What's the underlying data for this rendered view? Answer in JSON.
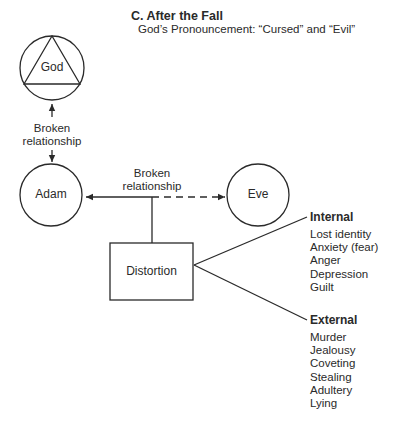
{
  "header": {
    "title": "C.  After the Fall",
    "subtitle": "God’s Pronouncement: “Cursed” and “Evil”"
  },
  "nodes": {
    "god": "God",
    "adam": "Adam",
    "eve": "Eve",
    "distortion": "Distortion"
  },
  "relationships": {
    "god_adam": {
      "line1": "Broken",
      "line2": "relationship"
    },
    "adam_eve": {
      "line1": "Broken",
      "line2": "relationship"
    }
  },
  "branches": {
    "internal": {
      "heading": "Internal",
      "items": [
        "Lost identity",
        "Anxiety (fear)",
        "Anger",
        "Depression",
        "Guilt"
      ]
    },
    "external": {
      "heading": "External",
      "items": [
        "Murder",
        "Jealousy",
        "Coveting",
        "Stealing",
        "Adultery",
        "Lying"
      ]
    }
  },
  "colors": {
    "ink": "#2a2a2a",
    "background": "#ffffff"
  }
}
